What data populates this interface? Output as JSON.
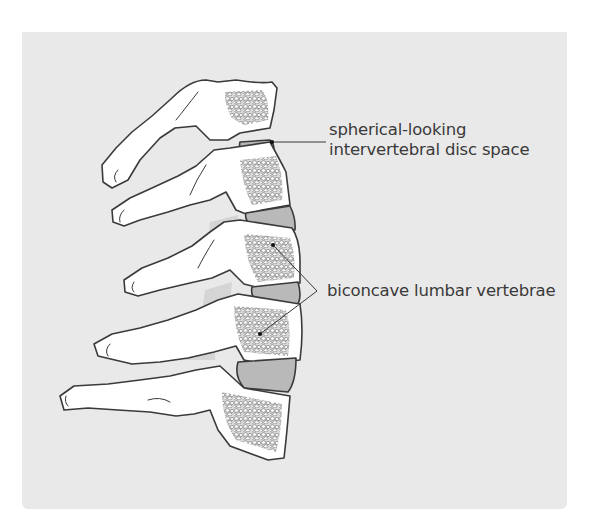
{
  "diagram": {
    "colors": {
      "background_panel": "#e9e9e9",
      "bone_fill": "#ffffff",
      "outline": "#3a3a3a",
      "disc_fill": "#b9b9b9",
      "cancellous_fill": "#d6d6d6",
      "label_text": "#3a3a3a"
    },
    "labels": [
      {
        "id": "disc",
        "lines": [
          "spherical-looking",
          "intervertebral disc space"
        ],
        "pointer": {
          "from": [
            326,
            142
          ],
          "to": [
            272,
            142
          ]
        }
      },
      {
        "id": "vertebrae",
        "lines": [
          "biconcave lumbar vertebrae"
        ],
        "pointer": {
          "junction": [
            317,
            291
          ],
          "targets": [
            [
              273,
              245
            ],
            [
              260,
              334
            ]
          ]
        }
      }
    ]
  }
}
